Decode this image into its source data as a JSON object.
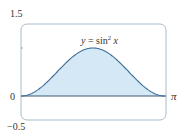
{
  "chart_data": {
    "type": "area",
    "title": "",
    "function_label": "y = sin² x",
    "xlabel": "",
    "ylabel": "",
    "x_range": [
      0,
      3.14159
    ],
    "ylim": [
      -0.5,
      1.5
    ],
    "x_tick_labels": [
      "0",
      "π"
    ],
    "y_tick_labels": [
      "1.5",
      "0",
      "−0.5"
    ],
    "grid": false,
    "legend": "none",
    "series": [
      {
        "name": "y = sin² x",
        "x": [
          0,
          0.3927,
          0.7854,
          1.1781,
          1.5708,
          1.9635,
          2.3562,
          2.7489,
          3.1416
        ],
        "values": [
          0,
          0.1464,
          0.5,
          0.8536,
          1.0,
          0.8536,
          0.5,
          0.1464,
          0
        ],
        "fill": "#d4e8f5",
        "stroke": "#3d6d99"
      }
    ],
    "colors": {
      "frame": "#9fb4c4",
      "axis": "#3d5a73",
      "fill": "#d4e8f5",
      "curve": "#3d6d99"
    }
  },
  "labels": {
    "y_top": "1.5",
    "y_zero": "0",
    "y_bottom": "−0.5",
    "x_end": "π",
    "func_y": "y",
    "func_eq": " = sin",
    "func_exp": "2",
    "func_x": " x"
  }
}
